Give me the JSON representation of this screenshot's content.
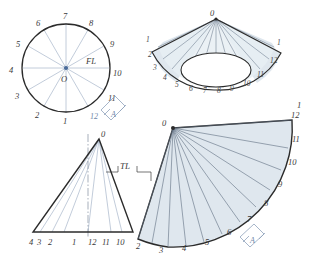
{
  "drawing": {
    "title": "Radial line development of a cone",
    "background_color": "#ffffff",
    "outline_color": "#2b2b2b",
    "element_line_color": "#6d7b8d",
    "fill_color": "#dfe7ee",
    "construction_color": "#8fa2bb",
    "label_color": "#3a3a3a"
  },
  "top_view": {
    "name": "top-view-circle",
    "center_label": "O",
    "true_length_label": "FL",
    "division_labels": [
      "1",
      "2",
      "3",
      "4",
      "5",
      "6",
      "7",
      "8",
      "9",
      "10",
      "11",
      "12"
    ],
    "divisions": 12,
    "arrow_label": "A"
  },
  "pictorial_view": {
    "name": "pictorial-cone-fan",
    "apex_label": "0",
    "left_labels": [
      "1",
      "2",
      "3"
    ],
    "base_labels": [
      "4",
      "5",
      "6",
      "7",
      "8",
      "9",
      "10"
    ],
    "right_labels": [
      "11",
      "12",
      "1"
    ]
  },
  "front_view": {
    "name": "front-view-triangle",
    "apex_label": "0",
    "true_length_label": "TL",
    "base_labels": [
      "4",
      "3",
      "2",
      "1",
      "12",
      "11",
      "10"
    ]
  },
  "development": {
    "name": "development-sector",
    "apex_label": "0",
    "start_label": "1",
    "arc_labels": [
      "2",
      "3",
      "4",
      "5",
      "6",
      "7",
      "8",
      "9",
      "10",
      "11",
      "12"
    ],
    "arrow_label": "A"
  }
}
